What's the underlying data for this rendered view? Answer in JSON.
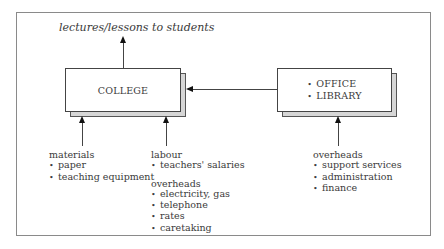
{
  "diagram": {
    "output_label": "lectures/lessons to students",
    "college_box": {
      "label": "COLLEGE"
    },
    "office_box": {
      "items": [
        "OFFICE",
        "LIBRARY"
      ]
    },
    "inputs": {
      "materials": {
        "heading": "materials",
        "items": [
          "paper",
          "teaching equipment"
        ]
      },
      "labour": {
        "heading": "labour",
        "items": [
          "teachers' salaries"
        ]
      },
      "college_overheads": {
        "heading": "overheads",
        "items": [
          "electricity, gas",
          "telephone",
          "rates",
          "caretaking"
        ]
      },
      "office_overheads": {
        "heading": "overheads",
        "items": [
          "support services",
          "administration",
          "finance"
        ]
      }
    },
    "edges": [
      {
        "from": "COLLEGE",
        "to": "lectures/lessons to students"
      },
      {
        "from": "OFFICE/LIBRARY",
        "to": "COLLEGE"
      },
      {
        "from": "materials",
        "to": "COLLEGE"
      },
      {
        "from": "labour/overheads",
        "to": "COLLEGE"
      },
      {
        "from": "overheads",
        "to": "OFFICE/LIBRARY"
      }
    ]
  }
}
